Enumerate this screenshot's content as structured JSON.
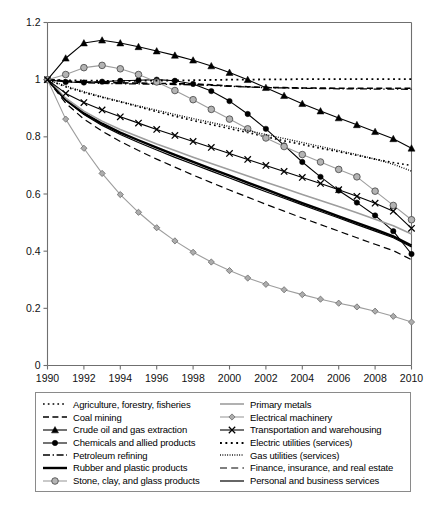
{
  "chart_data": {
    "type": "line",
    "title": "",
    "xlabel": "",
    "ylabel": "",
    "xlim": [
      1990,
      2010
    ],
    "ylim": [
      0,
      1.2
    ],
    "yticks": [
      0,
      0.2,
      0.4,
      0.6,
      0.8,
      1,
      1.2
    ],
    "ytick_labels": [
      "0",
      "0.2",
      "0.4",
      "0.6",
      "0.8",
      "1",
      "1.2"
    ],
    "xticks": [
      1990,
      1992,
      1994,
      1996,
      1998,
      2000,
      2002,
      2004,
      2006,
      2008,
      2010
    ],
    "xtick_labels": [
      "1990",
      "1992",
      "1994",
      "1996",
      "1998",
      "2000",
      "2002",
      "2004",
      "2006",
      "2008",
      "2010"
    ],
    "grid": false,
    "legend_position": "below",
    "x": [
      1990,
      1991,
      1992,
      1993,
      1994,
      1995,
      1996,
      1997,
      1998,
      1999,
      2000,
      2001,
      2002,
      2003,
      2004,
      2005,
      2006,
      2007,
      2008,
      2009,
      2010
    ],
    "series": [
      {
        "name": "Agriculture, forestry, fisheries",
        "style": "dotted-coarse",
        "color": "#000000",
        "marker": "none",
        "width": 1.6,
        "values": [
          1.0,
          0.975,
          0.955,
          0.938,
          0.922,
          0.905,
          0.888,
          0.872,
          0.857,
          0.843,
          0.829,
          0.815,
          0.8,
          0.786,
          0.773,
          0.76,
          0.748,
          0.735,
          0.722,
          0.71,
          0.7
        ]
      },
      {
        "name": "Coal mining",
        "style": "dashed",
        "color": "#000000",
        "marker": "none",
        "width": 1.6,
        "values": [
          1.0,
          0.995,
          0.992,
          0.99,
          0.989,
          0.988,
          0.987,
          0.986,
          0.985,
          0.982,
          0.978,
          0.975,
          0.973,
          0.972,
          0.971,
          0.971,
          0.97,
          0.97,
          0.97,
          0.97,
          0.97
        ]
      },
      {
        "name": "Crude oil and gas extraction",
        "style": "solid",
        "color": "#000000",
        "marker": "triangle",
        "width": 1.1,
        "values": [
          1.0,
          1.075,
          1.128,
          1.138,
          1.128,
          1.115,
          1.1,
          1.085,
          1.068,
          1.048,
          1.025,
          1.0,
          0.972,
          0.944,
          0.916,
          0.89,
          0.866,
          0.842,
          0.818,
          0.793,
          0.76
        ]
      },
      {
        "name": "Chemicals and allied products",
        "style": "solid",
        "color": "#000000",
        "marker": "circle-black",
        "width": 1.1,
        "values": [
          1.0,
          0.992,
          0.99,
          0.993,
          0.996,
          0.998,
          1.0,
          0.996,
          0.985,
          0.96,
          0.925,
          0.88,
          0.828,
          0.77,
          0.712,
          0.66,
          0.612,
          0.57,
          0.525,
          0.47,
          0.39
        ]
      },
      {
        "name": "Petroleum refining",
        "style": "dash-dot",
        "color": "#000000",
        "marker": "none",
        "width": 1.3,
        "values": [
          1.0,
          0.993,
          0.989,
          0.987,
          0.986,
          0.985,
          0.984,
          0.983,
          0.982,
          0.98,
          0.977,
          0.974,
          0.972,
          0.971,
          0.97,
          0.969,
          0.968,
          0.968,
          0.967,
          0.967,
          0.966
        ]
      },
      {
        "name": "Rubber and plastic products",
        "style": "solid",
        "color": "#000000",
        "marker": "none",
        "width": 2.4,
        "values": [
          1.0,
          0.93,
          0.882,
          0.846,
          0.815,
          0.788,
          0.762,
          0.737,
          0.712,
          0.688,
          0.664,
          0.64,
          0.616,
          0.592,
          0.568,
          0.545,
          0.522,
          0.499,
          0.476,
          0.452,
          0.42
        ]
      },
      {
        "name": "Stone, clay, and glass products",
        "style": "solid",
        "color": "#9d9d9d",
        "marker": "circle-gray",
        "width": 1.1,
        "values": [
          1.0,
          1.018,
          1.042,
          1.05,
          1.038,
          1.018,
          0.992,
          0.962,
          0.93,
          0.896,
          0.862,
          0.828,
          0.796,
          0.766,
          0.738,
          0.712,
          0.686,
          0.66,
          0.61,
          0.56,
          0.51
        ]
      },
      {
        "name": "Primary metals",
        "style": "solid",
        "color": "#9d9d9d",
        "marker": "none",
        "width": 1.6,
        "values": [
          1.0,
          0.935,
          0.89,
          0.855,
          0.826,
          0.8,
          0.775,
          0.752,
          0.729,
          0.707,
          0.685,
          0.663,
          0.641,
          0.62,
          0.598,
          0.577,
          0.556,
          0.534,
          0.512,
          0.489,
          0.46
        ]
      },
      {
        "name": "Electrical machinery",
        "style": "solid",
        "color": "#9d9d9d",
        "marker": "diamond-gray",
        "width": 1.1,
        "values": [
          1.0,
          0.862,
          0.76,
          0.672,
          0.598,
          0.536,
          0.482,
          0.436,
          0.396,
          0.362,
          0.332,
          0.306,
          0.284,
          0.265,
          0.248,
          0.232,
          0.218,
          0.205,
          0.19,
          0.172,
          0.152
        ]
      },
      {
        "name": "Transportation and warehousing",
        "style": "solid",
        "color": "#000000",
        "marker": "x",
        "width": 1.1,
        "values": [
          1.0,
          0.952,
          0.92,
          0.894,
          0.87,
          0.848,
          0.826,
          0.805,
          0.784,
          0.763,
          0.742,
          0.721,
          0.7,
          0.679,
          0.658,
          0.637,
          0.615,
          0.592,
          0.568,
          0.54,
          0.48
        ]
      },
      {
        "name": "Electric utilities (services)",
        "style": "dotted-coarse",
        "color": "#000000",
        "marker": "none",
        "width": 1.8,
        "values": [
          1.0,
          0.998,
          0.997,
          0.996,
          0.996,
          0.996,
          0.997,
          0.997,
          0.998,
          0.999,
          1.0,
          1.0,
          1.001,
          1.001,
          1.002,
          1.002,
          1.002,
          1.002,
          1.002,
          1.002,
          1.002
        ]
      },
      {
        "name": "Gas utilities (services)",
        "style": "dotted-fine",
        "color": "#000000",
        "marker": "none",
        "width": 1.4,
        "values": [
          1.0,
          0.978,
          0.958,
          0.94,
          0.924,
          0.908,
          0.893,
          0.878,
          0.864,
          0.85,
          0.836,
          0.822,
          0.808,
          0.794,
          0.78,
          0.766,
          0.752,
          0.738,
          0.722,
          0.704,
          0.68
        ]
      },
      {
        "name": "Finance, insurance, and real estate",
        "style": "dashed-long",
        "color": "#000000",
        "marker": "none",
        "width": 1.2,
        "values": [
          1.0,
          0.918,
          0.862,
          0.82,
          0.784,
          0.752,
          0.722,
          0.694,
          0.666,
          0.64,
          0.614,
          0.589,
          0.564,
          0.54,
          0.516,
          0.493,
          0.47,
          0.447,
          0.424,
          0.402,
          0.37
        ]
      },
      {
        "name": "Personal and business services",
        "style": "solid",
        "color": "#000000",
        "marker": "none",
        "width": 1.2,
        "values": [
          1.0,
          0.928,
          0.878,
          0.84,
          0.808,
          0.78,
          0.754,
          0.728,
          0.704,
          0.68,
          0.656,
          0.632,
          0.608,
          0.585,
          0.562,
          0.539,
          0.516,
          0.493,
          0.47,
          0.447,
          0.415
        ]
      }
    ]
  },
  "legend": {
    "left_items": [
      {
        "label": "Agriculture, forestry, fisheries",
        "series": 0
      },
      {
        "label": "Coal mining",
        "series": 1
      },
      {
        "label": "Crude oil and gas extraction",
        "series": 2
      },
      {
        "label": "Chemicals and allied products",
        "series": 3
      },
      {
        "label": "Petroleum refining",
        "series": 4
      },
      {
        "label": "Rubber and plastic products",
        "series": 5
      },
      {
        "label": "Stone, clay, and glass products",
        "series": 6
      }
    ],
    "right_items": [
      {
        "label": "Primary metals",
        "series": 7
      },
      {
        "label": "Electrical machinery",
        "series": 8
      },
      {
        "label": "Transportation and warehousing",
        "series": 9
      },
      {
        "label": "Electric utilities (services)",
        "series": 10
      },
      {
        "label": "Gas utilities (services)",
        "series": 11
      },
      {
        "label": "Finance, insurance, and real estate",
        "series": 12
      },
      {
        "label": "Personal and business services",
        "series": 13
      }
    ]
  },
  "colors": {
    "axis": "#6f6f6f",
    "black": "#000000",
    "gray": "#9d9d9d",
    "legend_border": "#8a8a8a"
  }
}
